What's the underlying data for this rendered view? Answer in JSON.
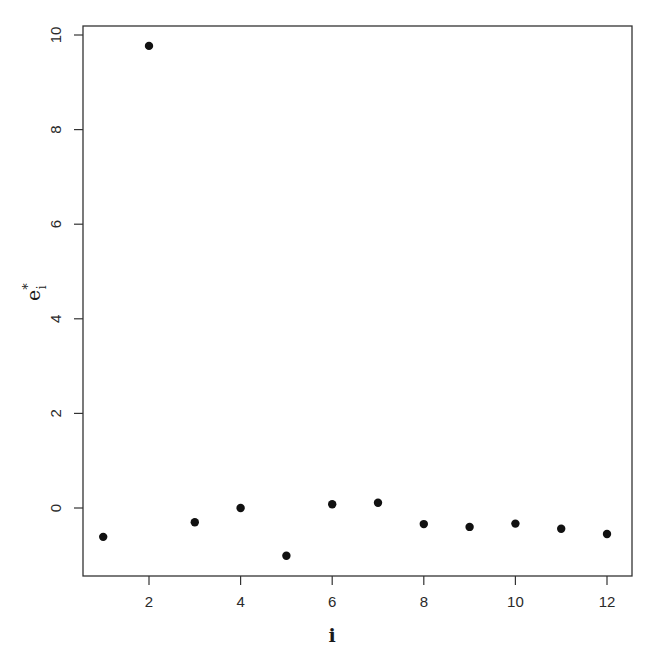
{
  "chart_data": {
    "type": "scatter",
    "title": "",
    "xlabel": "i",
    "ylabel": "e*_i",
    "ylabel_main": "e",
    "ylabel_sup": "*",
    "ylabel_sub": "i",
    "x": [
      1,
      2,
      3,
      4,
      5,
      6,
      7,
      8,
      9,
      10,
      11,
      12
    ],
    "y": [
      -0.61,
      9.77,
      -0.3,
      0.0,
      -1.01,
      0.08,
      0.11,
      -0.34,
      -0.4,
      -0.33,
      -0.44,
      -0.55
    ],
    "xlim": [
      0.6,
      12.55
    ],
    "ylim": [
      -1.44,
      10.2
    ],
    "xticks": [
      2,
      4,
      6,
      8,
      10,
      12
    ],
    "yticks": [
      0,
      2,
      4,
      6,
      8,
      10
    ],
    "grid": false,
    "legend": null,
    "marker": "filled-circle",
    "marker_color": "#111111"
  },
  "layout": {
    "plot_box": {
      "left": 83,
      "top": 26,
      "right": 632,
      "bottom": 576
    },
    "x_map": {
      "px_at_2": 149,
      "px_per_unit": 45.8
    },
    "y_map": {
      "px_at_0": 508,
      "px_per_unit": 47.3
    }
  }
}
